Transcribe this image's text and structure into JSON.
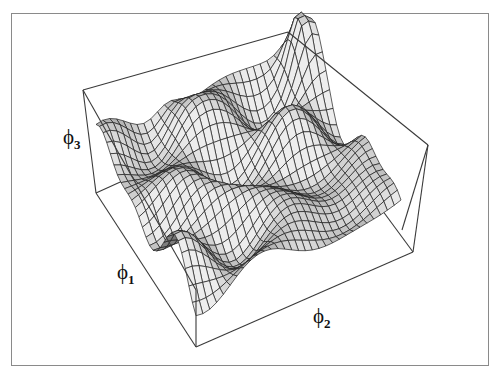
{
  "figure": {
    "type": "3d-surface-mesh",
    "frame_color": "#8a8a8a",
    "box_color": "#3a3a3a",
    "surface_shade_light": "#e6e6e6",
    "surface_shade_dark": "#2a2a2a",
    "mesh_line_color": "#1e1e1e"
  },
  "axes": {
    "x": {
      "symbol": "ϕ",
      "subscript": "1"
    },
    "y": {
      "symbol": "ϕ",
      "subscript": "2"
    },
    "z": {
      "symbol": "ϕ",
      "subscript": "3"
    }
  }
}
